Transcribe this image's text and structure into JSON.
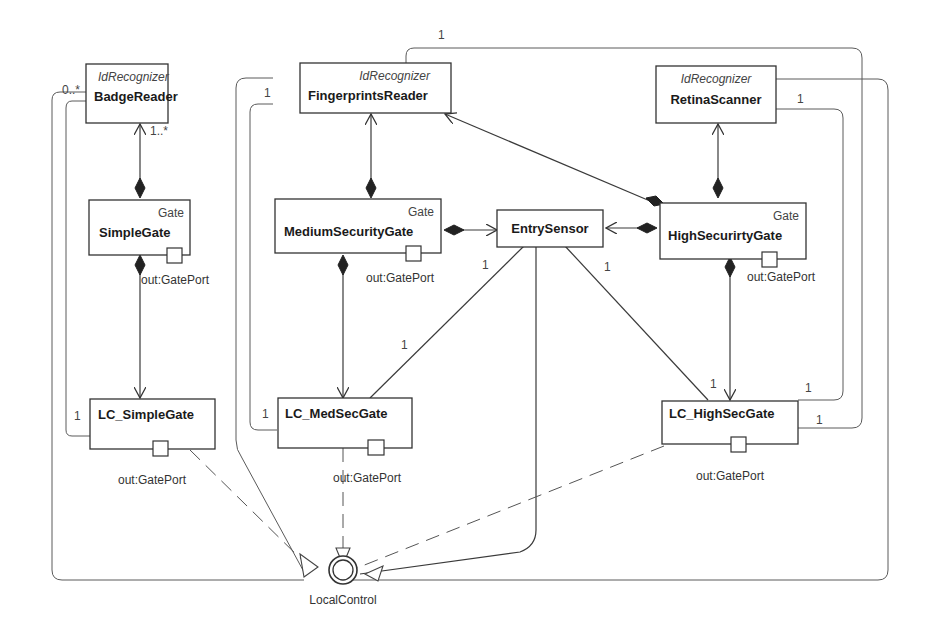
{
  "diagram": {
    "type": "UML composite structure / class diagram",
    "classes": {
      "badge_reader": {
        "stereotype": "IdRecognizer",
        "name": "BadgeReader"
      },
      "fingerprints_reader": {
        "stereotype": "IdRecognizer",
        "name": "FingerprintsReader"
      },
      "retina_scanner": {
        "stereotype": "IdRecognizer",
        "name": "RetinaScanner"
      },
      "simple_gate": {
        "stereotype": "Gate",
        "name": "SimpleGate",
        "port": "out:GatePort"
      },
      "medium_security_gate": {
        "stereotype": "Gate",
        "name": "MediumSecurityGate",
        "port": "out:GatePort"
      },
      "high_security_gate": {
        "stereotype": "Gate",
        "name": "HighSecurirtyGate",
        "port": "out:GatePort"
      },
      "entry_sensor": {
        "name": "EntrySensor"
      },
      "lc_simple_gate": {
        "name": "LC_SimpleGate",
        "port": "out:GatePort"
      },
      "lc_med_sec_gate": {
        "name": "LC_MedSecGate",
        "port": "out:GatePort"
      },
      "lc_high_sec_gate": {
        "name": "LC_HighSecGate",
        "port": "out:GatePort"
      }
    },
    "interface": {
      "name": "LocalControl"
    },
    "multiplicities": {
      "badge_reader_left": "0..*",
      "badge_reader_bottom": "1..*",
      "fingerprints_top": "1",
      "fingerprints_left": "1",
      "retina_right": "1",
      "lc_simple_left": "1",
      "lc_medsec_left": "1",
      "entry_to_lc_medsec": "1",
      "entry_from_medsec": "1",
      "entry_from_highsec": "1",
      "lc_highsec_top": "1",
      "lc_highsec_right_upper": "1",
      "lc_highsec_right_lower": "1"
    }
  }
}
